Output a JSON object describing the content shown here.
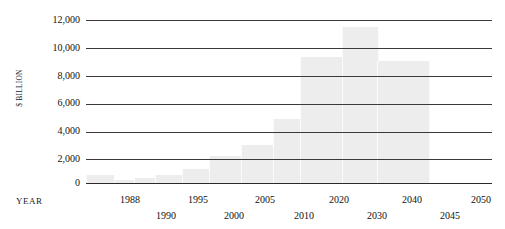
{
  "chart_data": {
    "type": "bar",
    "title": "",
    "title_cropped": true,
    "xlabel": "YEAR",
    "ylabel": "$ BILLION",
    "ylim": [
      0,
      12000
    ],
    "ytick_step": 2000,
    "ytick_labels": [
      "12,000",
      "10,000",
      "8,000",
      "6,000",
      "4,000",
      "2,000",
      "0"
    ],
    "ytick_values": [
      12000,
      10000,
      8000,
      6000,
      4000,
      2000,
      0
    ],
    "grid": true,
    "legend": "none",
    "categories": [
      "1988",
      "1990",
      "1995",
      "2000",
      "2005",
      "2010",
      "2020",
      "2030",
      "2040",
      "2045",
      "2050"
    ],
    "values": [
      200,
      350,
      600,
      1000,
      2000,
      2800,
      4700,
      9300,
      11500,
      9000,
      600
    ],
    "xtick_rows": [
      {
        "row": 0,
        "labels": [
          "1988",
          "1995",
          "2005",
          "2020",
          "2040",
          "2050"
        ]
      },
      {
        "row": 1,
        "labels": [
          "1990",
          "2000",
          "2010",
          "2030",
          "2045"
        ]
      }
    ],
    "colors": {
      "bar_fill": "#ededee",
      "gridline": "#3a3a3a",
      "axis_text": "#111111",
      "background": "#ffffff"
    }
  },
  "ytick_layout": [
    {
      "label": "12,000",
      "top": 15
    },
    {
      "label": "10,000",
      "top": 43
    },
    {
      "label": "8,000",
      "top": 71
    },
    {
      "label": "6,000",
      "top": 98
    },
    {
      "label": "4,000",
      "top": 126
    },
    {
      "label": "2,000",
      "top": 154
    },
    {
      "label": "0",
      "top": 178
    }
  ],
  "gridline_layout": [
    {
      "value": 12000,
      "top": 6
    },
    {
      "value": 10000,
      "top": 34
    },
    {
      "value": 8000,
      "top": 62
    },
    {
      "value": 6000,
      "top": 90
    },
    {
      "value": 4000,
      "top": 118
    },
    {
      "value": 2000,
      "top": 145
    },
    {
      "value": 0,
      "top": 169
    }
  ],
  "bar_layout": [
    {
      "category": "1988",
      "value": 200,
      "left": 27,
      "width": 21,
      "height": 3
    },
    {
      "category": "1990",
      "value": 350,
      "left": 48,
      "width": 21,
      "height": 5
    },
    {
      "category": "1995",
      "value": 600,
      "left": 69,
      "width": 27,
      "height": 8
    },
    {
      "category": "2000",
      "value": 1000,
      "left": 96,
      "width": 27,
      "height": 14
    },
    {
      "category": "2005",
      "value": 2000,
      "left": 123,
      "width": 32,
      "height": 27
    },
    {
      "category": "2010",
      "value": 2800,
      "left": 155,
      "width": 32,
      "height": 38
    },
    {
      "category": "2020",
      "value": 4700,
      "left": 187,
      "width": 27,
      "height": 64
    },
    {
      "category": "2030",
      "value": 9300,
      "left": 214,
      "width": 42,
      "height": 126
    },
    {
      "category": "2040",
      "value": 11500,
      "left": 256,
      "width": 35,
      "height": 156
    },
    {
      "category": "2045",
      "value": 9000,
      "left": 291,
      "width": 51,
      "height": 122
    },
    {
      "category": "2050",
      "value": 600,
      "left": 0,
      "width": 27,
      "height": 8
    }
  ],
  "xtick_layout": [
    {
      "label": "1988",
      "left": 130,
      "row": 0
    },
    {
      "label": "1990",
      "left": 166,
      "row": 1
    },
    {
      "label": "1995",
      "left": 198,
      "row": 0
    },
    {
      "label": "2000",
      "left": 234,
      "row": 1
    },
    {
      "label": "2005",
      "left": 265,
      "row": 0
    },
    {
      "label": "2010",
      "left": 304,
      "row": 1
    },
    {
      "label": "2020",
      "left": 339,
      "row": 0
    },
    {
      "label": "2030",
      "left": 377,
      "row": 1
    },
    {
      "label": "2040",
      "left": 412,
      "row": 0
    },
    {
      "label": "2045",
      "left": 450,
      "row": 1
    },
    {
      "label": "2050",
      "left": 481,
      "row": 0
    }
  ],
  "axis": {
    "year_label": "YEAR",
    "billion_label": "$ BILLION"
  },
  "title": {
    "text": ""
  }
}
